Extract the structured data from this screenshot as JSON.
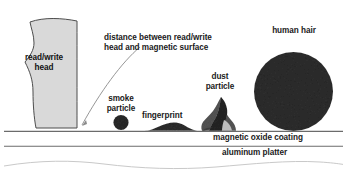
{
  "diagram": {
    "canvas": {
      "width": 347,
      "height": 179,
      "background": "#ffffff"
    },
    "colors": {
      "head_fill": "#d9d9d9",
      "head_stroke": "#4d4d4d",
      "particle_dark": "#2b2b2b",
      "dust_mid": "#6e6e6e",
      "dust_light": "#b8b8b8",
      "surface_line": "#6b6b6b",
      "wave_line": "#c9c9c9",
      "leader_line": "#8a8a8a",
      "text": "#1a1a1a"
    },
    "labels": {
      "read_write_head": "read/write\nhead",
      "distance": "distance between read/write\nhead and magnetic surface",
      "smoke_particle": "smoke\nparticle",
      "fingerprint": "fingerprint",
      "dust_particle": "dust\nparticle",
      "human_hair": "human hair",
      "magnetic_oxide_coating": "magnetic oxide coating",
      "aluminum_platter": "aluminum platter"
    },
    "objects": [
      {
        "name": "read-write-head",
        "kind": "polygon-blob",
        "label": "read/write head"
      },
      {
        "name": "smoke-particle",
        "kind": "circle",
        "label": "smoke particle"
      },
      {
        "name": "fingerprint",
        "kind": "mound",
        "label": "fingerprint"
      },
      {
        "name": "dust-particle",
        "kind": "jagged",
        "label": "dust particle"
      },
      {
        "name": "human-hair",
        "kind": "circle",
        "label": "human hair"
      }
    ],
    "layers": [
      {
        "name": "magnetic-oxide-coating",
        "label": "magnetic oxide coating"
      },
      {
        "name": "aluminum-platter",
        "label": "aluminum platter"
      }
    ]
  }
}
